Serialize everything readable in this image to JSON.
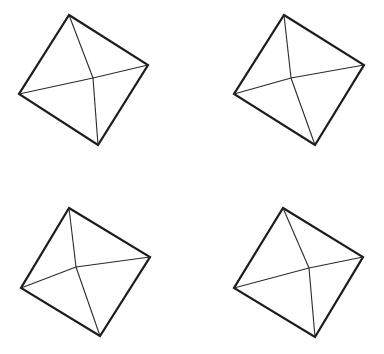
{
  "diagram": {
    "type": "pyramid-top-views",
    "stroke_color": "#1c1c1c",
    "background": "#ffffff",
    "shapes": [
      {
        "id": "pyramid-1",
        "outline": [
          [
            69,
            15
          ],
          [
            148,
            65
          ],
          [
            98,
            145
          ],
          [
            19,
            94
          ]
        ],
        "apex": [
          93,
          78
        ]
      },
      {
        "id": "pyramid-2",
        "outline": [
          [
            284,
            15
          ],
          [
            364,
            65
          ],
          [
            315,
            145
          ],
          [
            234,
            94
          ]
        ],
        "apex": [
          291,
          78
        ]
      },
      {
        "id": "pyramid-3",
        "outline": [
          [
            69,
            208
          ],
          [
            150,
            257
          ],
          [
            100,
            336
          ],
          [
            21,
            288
          ]
        ],
        "apex": [
          76,
          267
        ]
      },
      {
        "id": "pyramid-4",
        "outline": [
          [
            283,
            208
          ],
          [
            363,
            257
          ],
          [
            315,
            337
          ],
          [
            234,
            288
          ]
        ],
        "apex": [
          309,
          268
        ]
      }
    ]
  }
}
